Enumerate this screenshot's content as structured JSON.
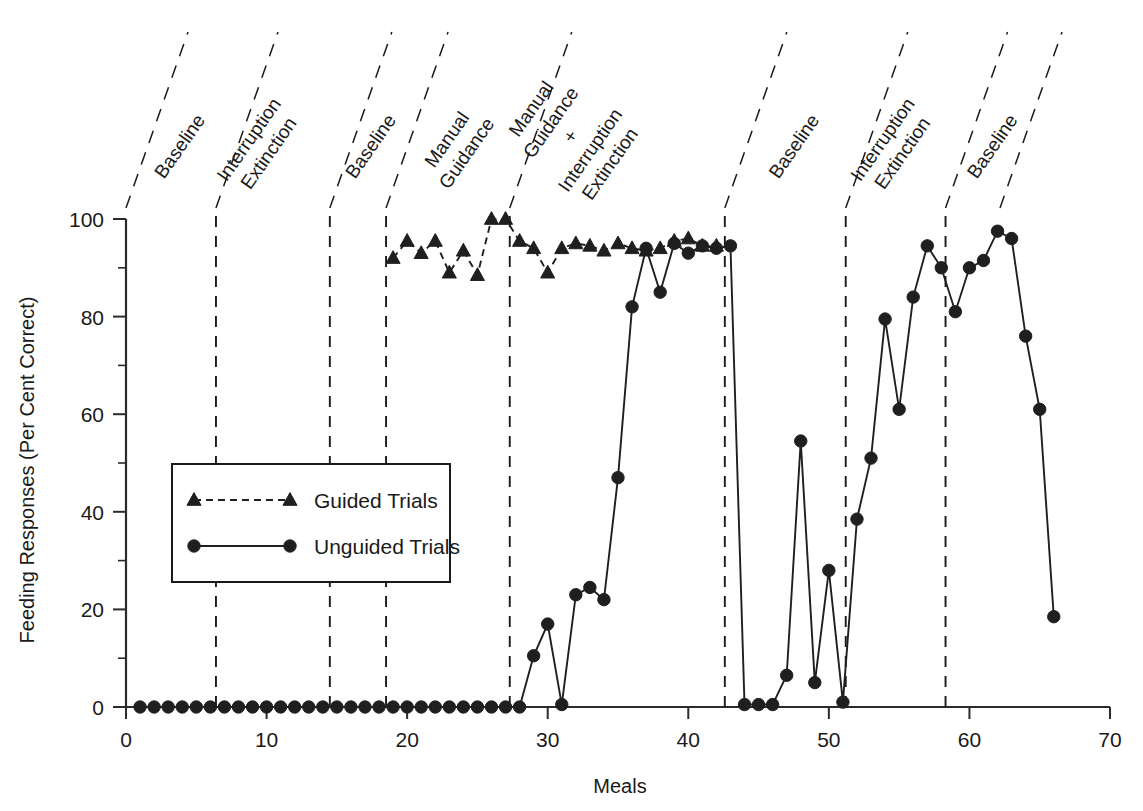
{
  "chart_data": {
    "type": "line",
    "title": "",
    "xlabel": "Meals",
    "ylabel": "Feeding Responses (Per Cent Correct)",
    "xlim": [
      0,
      70
    ],
    "ylim": [
      0,
      100
    ],
    "xticks": [
      0,
      10,
      20,
      30,
      40,
      50,
      60,
      70
    ],
    "xtick_labels": [
      "0",
      "10",
      "20",
      "30",
      "40",
      "50",
      "60",
      "70"
    ],
    "yticks": [
      0,
      20,
      40,
      60,
      80,
      100
    ],
    "ytick_labels": [
      "0",
      "20",
      "40",
      "60",
      "80",
      "100"
    ],
    "yticks_minor": [
      10,
      30,
      50,
      70,
      90
    ],
    "grid": false,
    "legend_position": "center-left",
    "series": [
      {
        "name": "Unguided Trials",
        "marker": "circle",
        "linestyle": "solid",
        "color": "#1f1f1f",
        "x": [
          1,
          2,
          3,
          4,
          5,
          6,
          7,
          8,
          9,
          10,
          11,
          12,
          13,
          14,
          15,
          16,
          17,
          18,
          19,
          20,
          21,
          22,
          23,
          24,
          25,
          26,
          27,
          28,
          29,
          30,
          31,
          32,
          33,
          34,
          35,
          36,
          37,
          38,
          39,
          40,
          41,
          42,
          43,
          44,
          45,
          46,
          47,
          48,
          49,
          50,
          51,
          52,
          53,
          54,
          55,
          56,
          57,
          58,
          59,
          60,
          61,
          62,
          63,
          64,
          65,
          66
        ],
        "values": [
          0,
          0,
          0,
          0,
          0,
          0,
          0,
          0,
          0,
          0,
          0,
          0,
          0,
          0,
          0,
          0,
          0,
          0,
          0,
          0,
          0,
          0,
          0,
          0,
          0,
          0,
          0,
          0,
          10.5,
          17,
          0.5,
          23,
          24.5,
          22,
          47,
          82,
          94,
          85,
          95,
          93,
          94.5,
          94,
          94.5,
          0.5,
          0.5,
          0.5,
          6.5,
          54.5,
          5,
          28,
          1,
          38.5,
          51,
          79.5,
          61,
          84,
          94.5,
          90,
          81,
          90,
          91.5,
          97.5,
          96,
          76,
          61,
          18.5
        ]
      },
      {
        "name": "Guided Trials",
        "marker": "triangle",
        "linestyle": "dashed",
        "color": "#1f1f1f",
        "x": [
          19,
          20,
          21,
          22,
          23,
          24,
          25,
          26,
          27,
          28,
          29,
          30,
          31,
          32,
          33,
          34,
          35,
          36,
          37,
          38,
          39,
          40,
          41,
          42
        ],
        "values": [
          92,
          95.5,
          93,
          95.5,
          89,
          93.5,
          88.5,
          100,
          100,
          95.5,
          94,
          89,
          94,
          95,
          94.5,
          93.5,
          95,
          94,
          93.5,
          94,
          95.5,
          96,
          94.5,
          94.5
        ]
      }
    ],
    "phases": [
      {
        "label_lines": [
          "Baseline"
        ],
        "x_start": 0,
        "x_end": 6.4
      },
      {
        "label_lines": [
          "Interruption",
          "Extinction"
        ],
        "x_start": 6.4,
        "x_end": 14.5
      },
      {
        "label_lines": [
          "Baseline"
        ],
        "x_start": 14.5,
        "x_end": 18.5
      },
      {
        "label_lines": [
          "Manual",
          "Guidance"
        ],
        "x_start": 18.5,
        "x_end": 27.3
      },
      {
        "label_lines": [
          "Manual",
          "Guidance",
          "+",
          "Interruption",
          "Extinction"
        ],
        "x_start": 27.3,
        "x_end": 42.6
      },
      {
        "label_lines": [
          "Baseline"
        ],
        "x_start": 42.6,
        "x_end": 51.2
      },
      {
        "label_lines": [
          "Interruption",
          "Extinction"
        ],
        "x_start": 51.2,
        "x_end": 58.3
      },
      {
        "label_lines": [
          "Baseline"
        ],
        "x_start": 58.3,
        "x_end": 70
      }
    ],
    "phase_dividers": [
      6.4,
      14.5,
      18.5,
      27.3,
      42.6,
      51.2,
      58.3
    ]
  },
  "legend": {
    "entries": [
      {
        "label": "Guided Trials",
        "marker": "triangle",
        "linestyle": "dashed"
      },
      {
        "label": "Unguided Trials",
        "marker": "circle",
        "linestyle": "solid"
      }
    ]
  },
  "colors": {
    "ink": "#1a1a1a",
    "series": "#1f1f1f",
    "background": "#ffffff"
  }
}
